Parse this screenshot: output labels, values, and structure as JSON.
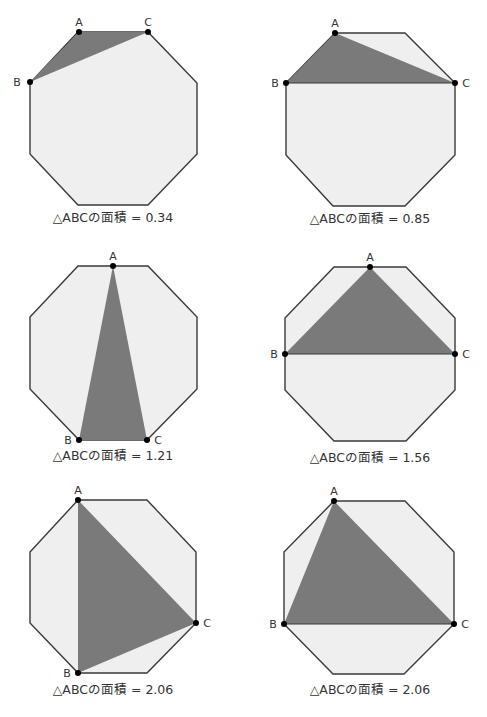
{
  "figure": {
    "point_labels": {
      "A": "A",
      "B": "B",
      "C": "C"
    },
    "panels": [
      {
        "caption": "△ABCの面積 = 0.34",
        "area": 0.34,
        "octagon": "78,32 148,32 197,83 197,154 148,205 78,205 30,154 30,83",
        "triangle": "79,32 30,82 148,32",
        "A": [
          79,
          32
        ],
        "B": [
          30,
          82
        ],
        "C": [
          148,
          32
        ],
        "labels": {
          "A": [
            79,
            24
          ],
          "B": [
            16,
            86
          ],
          "C": [
            148,
            24
          ]
        },
        "caption_pos": [
          113,
          220
        ]
      },
      {
        "caption": "△ABCの面積 = 0.85",
        "area": 0.85,
        "octagon": "335,33 405,33 455,83 455,155 405,206 333,206 286,155 286,83",
        "triangle": "335,33 286,83 455,83",
        "A": [
          335,
          33
        ],
        "B": [
          286,
          83
        ],
        "C": [
          455,
          83
        ],
        "labels": {
          "A": [
            335,
            25
          ],
          "B": [
            275,
            87
          ],
          "C": [
            466,
            87
          ]
        },
        "caption_pos": [
          370,
          222
        ]
      },
      {
        "caption": "△ABCの面積 = 1.21",
        "area": 1.21,
        "octagon": "78,266 148,266 197,317 197,389 147,440 79,440 30,389 30,317",
        "triangle": "113,266 79,440 147,440",
        "A": [
          113,
          266
        ],
        "B": [
          79,
          440
        ],
        "C": [
          147,
          440
        ],
        "labels": {
          "A": [
            113,
            258
          ],
          "B": [
            68,
            444
          ],
          "C": [
            158,
            444
          ]
        },
        "caption_pos": [
          113,
          459
        ]
      },
      {
        "caption": "△ABCの面積 = 1.56",
        "area": 1.56,
        "octagon": "334,267 406,267 455,318 455,390 406,441 334,441 285,390 285,318",
        "triangle": "370,267 285,354 455,354",
        "A": [
          370,
          267
        ],
        "B": [
          285,
          354
        ],
        "C": [
          455,
          354
        ],
        "labels": {
          "A": [
            370,
            259
          ],
          "B": [
            274,
            358
          ],
          "C": [
            466,
            358
          ]
        },
        "caption_pos": [
          370,
          461
        ]
      },
      {
        "caption": "△ABCの面積 = 2.06",
        "area": 2.06,
        "octagon": "78,500 147,500 196,552 196,623 147,673 78,673 30,623 30,552",
        "triangle": "78,500 78,673 196,623",
        "A": [
          78,
          500
        ],
        "B": [
          78,
          673
        ],
        "C": [
          196,
          623
        ],
        "labels": {
          "A": [
            78,
            492
          ],
          "B": [
            67,
            677
          ],
          "C": [
            207,
            627
          ]
        },
        "caption_pos": [
          113,
          693
        ]
      },
      {
        "caption": "△ABCの面積 = 2.06",
        "area": 2.06,
        "octagon": "334,501 405,501 454,552 454,624 404,674 333,674 284,624 284,552",
        "triangle": "334,501 284,624 454,624",
        "A": [
          334,
          501
        ],
        "B": [
          284,
          624
        ],
        "C": [
          454,
          624
        ],
        "labels": {
          "A": [
            334,
            493
          ],
          "B": [
            273,
            628
          ],
          "C": [
            465,
            628
          ]
        },
        "caption_pos": [
          370,
          693
        ]
      }
    ],
    "colors": {
      "octagon_fill": "#efefef",
      "triangle_fill": "#7a7a7a",
      "stroke": "#3a3a3a",
      "text": "#333333"
    }
  }
}
